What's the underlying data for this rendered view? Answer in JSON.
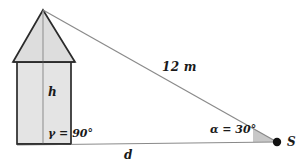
{
  "figure": {
    "type": "geometry-diagram",
    "colors": {
      "stroke": "#2b2b2b",
      "thin_stroke": "#6f6f6f",
      "fill_body": "#e3e3e3",
      "fill_roof": "#dcdcdc",
      "arc_fill": "#b8b8b8",
      "point_fill": "#111111",
      "background": "#ffffff"
    },
    "labels": {
      "height": "h",
      "distance": "d",
      "hypotenuse": "12 m",
      "gamma": "γ = 90°",
      "alpha": "α = 30°",
      "observer_point": "S"
    },
    "values": {
      "hypotenuse_length": "12",
      "hypotenuse_unit": "m",
      "gamma_degrees": "90",
      "alpha_degrees": "30"
    },
    "geometry": {
      "apex": [
        43,
        10
      ],
      "roof_base_left": [
        13,
        62
      ],
      "roof_base_right": [
        75,
        62
      ],
      "body_left": [
        17,
        62
      ],
      "body_right": [
        71,
        62
      ],
      "base_left": [
        17,
        144
      ],
      "base_right": [
        71,
        144
      ],
      "foot": [
        43,
        144
      ],
      "observer": [
        277,
        142
      ],
      "baseline_start": [
        17,
        145
      ],
      "baseline_end": [
        277,
        142
      ]
    }
  }
}
